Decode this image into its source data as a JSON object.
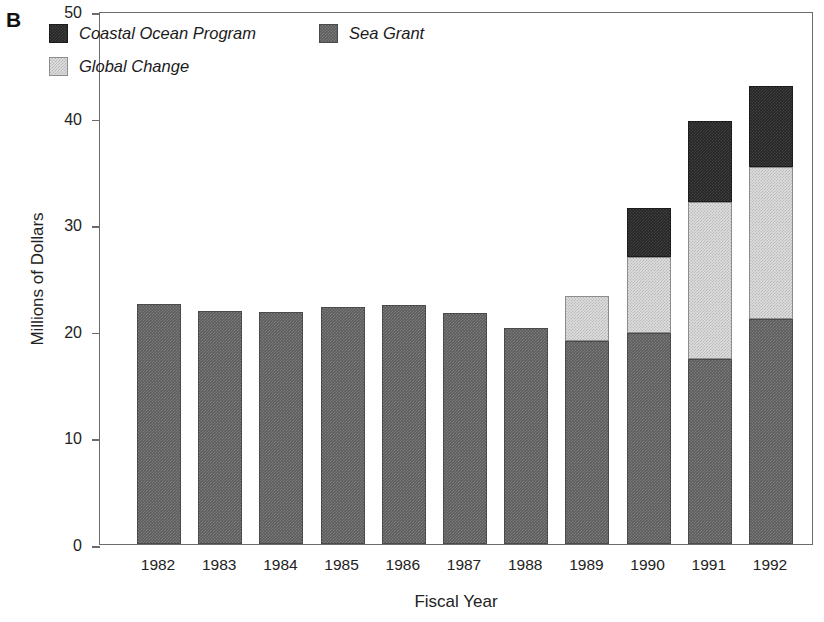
{
  "panel": {
    "letter": "B"
  },
  "chart_data": {
    "type": "bar",
    "stacked": true,
    "title": "",
    "xlabel": "Fiscal Year",
    "ylabel": "Millions of Dollars",
    "ylim": [
      0,
      50
    ],
    "yticks": [
      0,
      10,
      20,
      30,
      40,
      50
    ],
    "ytick_labels": [
      "0",
      "10",
      "20",
      "30",
      "40",
      "50"
    ],
    "grid": false,
    "legend_position": "top-left-inside",
    "categories": [
      "1982",
      "1983",
      "1984",
      "1985",
      "1986",
      "1987",
      "1988",
      "1989",
      "1990",
      "1991",
      "1992"
    ],
    "series": [
      {
        "name": "Sea Grant",
        "color": "#5d5d5d",
        "values": [
          22.5,
          21.9,
          21.8,
          22.2,
          22.4,
          21.7,
          20.3,
          19.0,
          19.8,
          17.4,
          21.1
        ]
      },
      {
        "name": "Global Change",
        "color": "#dedede",
        "values": [
          0,
          0,
          0,
          0,
          0,
          0,
          0,
          4.3,
          7.1,
          14.7,
          14.3
        ]
      },
      {
        "name": "Coastal Ocean Program",
        "color": "#262626",
        "values": [
          0,
          0,
          0,
          0,
          0,
          0,
          0,
          0,
          4.6,
          7.6,
          7.6
        ]
      }
    ],
    "totals": [
      22.5,
      21.9,
      21.8,
      22.2,
      22.4,
      21.7,
      20.3,
      23.3,
      31.5,
      39.7,
      43.0
    ]
  },
  "legend": {
    "items": [
      {
        "label": "Coastal Ocean Program",
        "swatch": "#262626"
      },
      {
        "label": "Sea Grant",
        "swatch": "#5d5d5d"
      },
      {
        "label": "Global Change",
        "swatch": "#dedede"
      }
    ]
  }
}
